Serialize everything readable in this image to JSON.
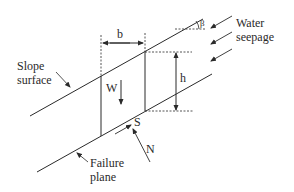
{
  "diagram": {
    "labels": {
      "slope_surface_line1": "Slope",
      "slope_surface_line2": "surface",
      "failure_plane_line1": "Failure",
      "failure_plane_line2": "plane",
      "water_seepage_line1": "Water",
      "water_seepage_line2": "seepage",
      "slice_width": "b",
      "slice_height": "h",
      "weight": "W",
      "shear_force": "S",
      "normal_force": "N",
      "slope_angle": "β"
    },
    "colors": {
      "line": "#2a2a2a",
      "background": "#ffffff"
    }
  }
}
